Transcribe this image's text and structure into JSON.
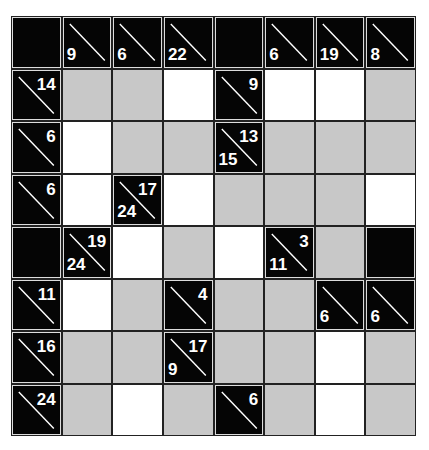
{
  "puzzle": {
    "type": "kakuro",
    "rows": 8,
    "cols": 8,
    "colors": {
      "black": "#050505",
      "white": "#ffffff",
      "gray": "#c8c8c8",
      "border": "#222222"
    },
    "grid": [
      [
        {
          "t": "black"
        },
        {
          "t": "clue",
          "down": "9"
        },
        {
          "t": "clue",
          "down": "6"
        },
        {
          "t": "clue",
          "down": "22"
        },
        {
          "t": "black"
        },
        {
          "t": "clue",
          "down": "6"
        },
        {
          "t": "clue",
          "down": "19"
        },
        {
          "t": "clue",
          "down": "8"
        }
      ],
      [
        {
          "t": "clue",
          "across": "14"
        },
        {
          "t": "gray"
        },
        {
          "t": "gray"
        },
        {
          "t": "white"
        },
        {
          "t": "clue",
          "across": "9"
        },
        {
          "t": "white"
        },
        {
          "t": "white"
        },
        {
          "t": "gray"
        }
      ],
      [
        {
          "t": "clue",
          "across": "6"
        },
        {
          "t": "white"
        },
        {
          "t": "gray"
        },
        {
          "t": "gray"
        },
        {
          "t": "clue",
          "across": "13",
          "down": "15"
        },
        {
          "t": "gray"
        },
        {
          "t": "gray"
        },
        {
          "t": "gray"
        }
      ],
      [
        {
          "t": "clue",
          "across": "6"
        },
        {
          "t": "white"
        },
        {
          "t": "clue",
          "across": "17",
          "down": "24"
        },
        {
          "t": "white"
        },
        {
          "t": "gray"
        },
        {
          "t": "gray"
        },
        {
          "t": "gray"
        },
        {
          "t": "white"
        }
      ],
      [
        {
          "t": "black"
        },
        {
          "t": "clue",
          "across": "19",
          "down": "24"
        },
        {
          "t": "white"
        },
        {
          "t": "gray"
        },
        {
          "t": "white"
        },
        {
          "t": "clue",
          "across": "3",
          "down": "11"
        },
        {
          "t": "gray"
        },
        {
          "t": "black"
        }
      ],
      [
        {
          "t": "clue",
          "across": "11"
        },
        {
          "t": "white"
        },
        {
          "t": "gray"
        },
        {
          "t": "clue",
          "across": "4"
        },
        {
          "t": "gray"
        },
        {
          "t": "gray"
        },
        {
          "t": "clue",
          "down": "6"
        },
        {
          "t": "clue",
          "down": "6"
        }
      ],
      [
        {
          "t": "clue",
          "across": "16"
        },
        {
          "t": "gray"
        },
        {
          "t": "gray"
        },
        {
          "t": "clue",
          "across": "17",
          "down": "9"
        },
        {
          "t": "gray"
        },
        {
          "t": "gray"
        },
        {
          "t": "white"
        },
        {
          "t": "gray"
        }
      ],
      [
        {
          "t": "clue",
          "across": "24"
        },
        {
          "t": "gray"
        },
        {
          "t": "white"
        },
        {
          "t": "gray"
        },
        {
          "t": "clue",
          "across": "6"
        },
        {
          "t": "gray"
        },
        {
          "t": "white"
        },
        {
          "t": "gray"
        }
      ]
    ]
  }
}
